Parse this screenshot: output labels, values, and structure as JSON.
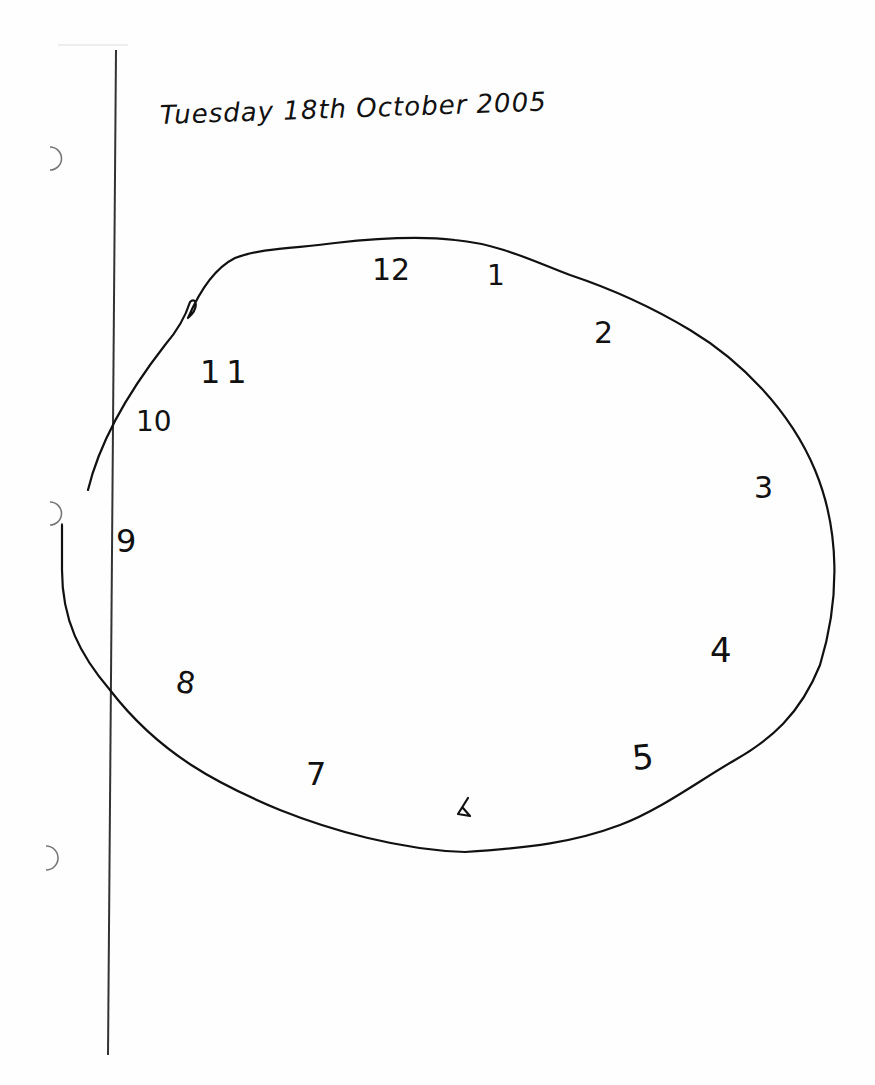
{
  "document": {
    "type": "handwritten clock drawing on lined notebook paper",
    "header_text": "Tuesday 18th October 2005",
    "header_text_as_written": "TuTuesday 18th October 2005"
  },
  "clock": {
    "shape": "irregular oval, hand-drawn",
    "numerals": [
      {
        "label": "12",
        "x": 385,
        "y": 272
      },
      {
        "label": "1",
        "x": 493,
        "y": 277
      },
      {
        "label": "2",
        "x": 608,
        "y": 338
      },
      {
        "label": "3",
        "x": 765,
        "y": 490
      },
      {
        "label": "4",
        "x": 725,
        "y": 655
      },
      {
        "label": "5",
        "x": 643,
        "y": 765
      },
      {
        "label": "6",
        "x": 462,
        "y": 805
      },
      {
        "label": "7",
        "x": 318,
        "y": 780
      },
      {
        "label": "8",
        "x": 186,
        "y": 690
      },
      {
        "label": "9",
        "x": 128,
        "y": 545
      },
      {
        "label": "10",
        "x": 150,
        "y": 425
      },
      {
        "label": "11",
        "x": 215,
        "y": 378
      }
    ],
    "hands": "none drawn"
  },
  "paper": {
    "margin_line_x": 112,
    "punch_holes_y": [
      157,
      512,
      860
    ],
    "ink_color": "#111111",
    "paper_color": "#fefefe"
  }
}
